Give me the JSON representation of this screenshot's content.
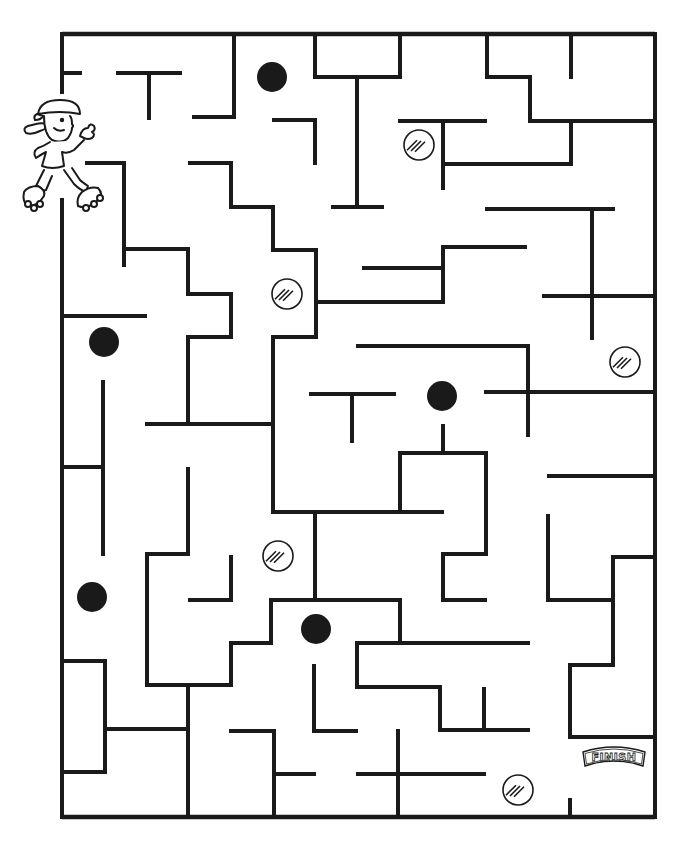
{
  "game": {
    "type": "maze",
    "finish_label": "FINISH",
    "colors": {
      "ink": "#1a1a1a",
      "paper": "#ffffff"
    },
    "border": {
      "x1": 62,
      "y1": 34,
      "x2": 655,
      "y2": 817
    },
    "start": {
      "character": "roller-skater-girl",
      "x": 62,
      "y": 92,
      "gap_y": [
        92,
        200
      ]
    },
    "finish": {
      "x": 613,
      "y": 757,
      "exit": "bottom-right"
    },
    "solid_balls": [
      {
        "cx": 272,
        "cy": 77
      },
      {
        "cx": 104,
        "cy": 342
      },
      {
        "cx": 442,
        "cy": 396
      },
      {
        "cx": 92,
        "cy": 597
      },
      {
        "cx": 316,
        "cy": 629
      }
    ],
    "hatched_balls": [
      {
        "cx": 419,
        "cy": 145
      },
      {
        "cx": 287,
        "cy": 294
      },
      {
        "cx": 625,
        "cy": 362
      },
      {
        "cx": 278,
        "cy": 556
      },
      {
        "cx": 518,
        "cy": 790
      }
    ],
    "walls": [
      [
        62,
        34,
        62,
        92
      ],
      [
        62,
        200,
        62,
        817
      ],
      [
        62,
        73,
        80,
        73
      ],
      [
        118,
        73,
        180,
        73
      ],
      [
        149,
        73,
        149,
        118
      ],
      [
        234,
        34,
        234,
        117
      ],
      [
        194,
        117,
        234,
        117
      ],
      [
        315,
        34,
        315,
        77
      ],
      [
        315,
        77,
        400,
        77
      ],
      [
        400,
        34,
        400,
        77
      ],
      [
        357,
        77,
        357,
        207
      ],
      [
        333,
        207,
        382,
        207
      ],
      [
        487,
        34,
        487,
        77
      ],
      [
        487,
        77,
        530,
        77
      ],
      [
        530,
        77,
        530,
        121
      ],
      [
        530,
        121,
        655,
        121
      ],
      [
        571,
        34,
        571,
        77
      ],
      [
        274,
        120,
        315,
        120
      ],
      [
        315,
        120,
        315,
        163
      ],
      [
        400,
        121,
        485,
        121
      ],
      [
        443,
        121,
        443,
        188
      ],
      [
        443,
        164,
        571,
        164
      ],
      [
        571,
        121,
        571,
        164
      ],
      [
        87,
        163,
        124,
        163
      ],
      [
        124,
        163,
        124,
        265
      ],
      [
        124,
        249,
        188,
        249
      ],
      [
        188,
        249,
        188,
        294
      ],
      [
        188,
        294,
        231,
        294
      ],
      [
        231,
        294,
        231,
        337
      ],
      [
        190,
        163,
        231,
        163
      ],
      [
        231,
        163,
        231,
        207
      ],
      [
        231,
        207,
        273,
        207
      ],
      [
        273,
        207,
        273,
        250
      ],
      [
        273,
        250,
        316,
        250
      ],
      [
        316,
        250,
        316,
        337
      ],
      [
        316,
        302,
        443,
        302
      ],
      [
        443,
        247,
        443,
        302
      ],
      [
        443,
        247,
        525,
        247
      ],
      [
        364,
        268,
        443,
        268
      ],
      [
        487,
        209,
        613,
        209
      ],
      [
        592,
        209,
        592,
        338
      ],
      [
        544,
        296,
        655,
        296
      ],
      [
        62,
        316,
        145,
        316
      ],
      [
        188,
        337,
        231,
        337
      ],
      [
        188,
        337,
        188,
        424
      ],
      [
        273,
        337,
        316,
        337
      ],
      [
        273,
        337,
        273,
        512
      ],
      [
        147,
        424,
        273,
        424
      ],
      [
        103,
        382,
        103,
        554
      ],
      [
        62,
        467,
        103,
        467
      ],
      [
        358,
        346,
        528,
        346
      ],
      [
        528,
        346,
        528,
        435
      ],
      [
        486,
        392,
        655,
        392
      ],
      [
        311,
        394,
        394,
        394
      ],
      [
        352,
        394,
        352,
        441
      ],
      [
        443,
        426,
        443,
        453
      ],
      [
        400,
        453,
        486,
        453
      ],
      [
        400,
        453,
        400,
        512
      ],
      [
        486,
        453,
        486,
        554
      ],
      [
        273,
        512,
        442,
        512
      ],
      [
        315,
        512,
        315,
        600
      ],
      [
        188,
        469,
        188,
        554
      ],
      [
        147,
        554,
        188,
        554
      ],
      [
        147,
        554,
        147,
        685
      ],
      [
        190,
        600,
        231,
        600
      ],
      [
        231,
        557,
        231,
        600
      ],
      [
        443,
        554,
        486,
        554
      ],
      [
        443,
        554,
        443,
        600
      ],
      [
        443,
        600,
        485,
        600
      ],
      [
        549,
        476,
        655,
        476
      ],
      [
        548,
        516,
        548,
        600
      ],
      [
        548,
        600,
        613,
        600
      ],
      [
        613,
        557,
        613,
        600
      ],
      [
        613,
        557,
        655,
        557
      ],
      [
        613,
        600,
        613,
        665
      ],
      [
        570,
        665,
        613,
        665
      ],
      [
        570,
        665,
        570,
        737
      ],
      [
        570,
        737,
        655,
        737
      ],
      [
        271,
        600,
        400,
        600
      ],
      [
        400,
        600,
        400,
        643
      ],
      [
        271,
        600,
        271,
        643
      ],
      [
        231,
        643,
        271,
        643
      ],
      [
        231,
        643,
        231,
        685
      ],
      [
        147,
        685,
        231,
        685
      ],
      [
        188,
        685,
        188,
        817
      ],
      [
        105,
        729,
        188,
        729
      ],
      [
        62,
        661,
        105,
        661
      ],
      [
        105,
        661,
        105,
        772
      ],
      [
        62,
        772,
        105,
        772
      ],
      [
        357,
        643,
        528,
        643
      ],
      [
        357,
        643,
        357,
        687
      ],
      [
        357,
        687,
        440,
        687
      ],
      [
        440,
        687,
        440,
        730
      ],
      [
        440,
        730,
        528,
        730
      ],
      [
        484,
        689,
        484,
        730
      ],
      [
        314,
        666,
        314,
        731
      ],
      [
        314,
        731,
        356,
        731
      ],
      [
        231,
        731,
        274,
        731
      ],
      [
        274,
        731,
        274,
        817
      ],
      [
        274,
        774,
        314,
        774
      ],
      [
        358,
        774,
        484,
        774
      ],
      [
        398,
        731,
        398,
        817
      ],
      [
        570,
        800,
        570,
        817
      ],
      [
        655,
        34,
        655,
        817
      ]
    ]
  }
}
